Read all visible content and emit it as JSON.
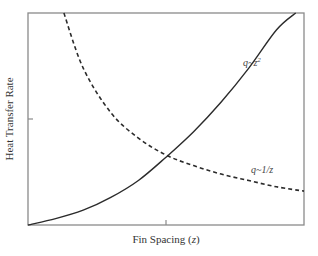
{
  "chart_data": {
    "type": "line",
    "title": "",
    "xlabel": "Fin Spacing (z)",
    "xlabel_text": "Fin Spacing (",
    "xlabel_var": "z",
    "xlabel_close": ")",
    "ylabel": "Heat Transfer Rate",
    "xlim": [
      0,
      1
    ],
    "ylim": [
      0,
      1
    ],
    "grid": false,
    "legend": null,
    "x_ticks": [
      0.5
    ],
    "y_ticks": [
      0.5
    ],
    "tick_labels_shown": false,
    "series": [
      {
        "name": "q~z^2",
        "style": "solid",
        "label": "q~z",
        "label_sup": "2",
        "x": [
          0.0,
          0.1,
          0.2,
          0.3,
          0.4,
          0.5,
          0.6,
          0.7,
          0.8,
          0.9,
          0.97
        ],
        "y": [
          0.0,
          0.03,
          0.07,
          0.13,
          0.21,
          0.32,
          0.44,
          0.58,
          0.74,
          0.92,
          1.0
        ]
      },
      {
        "name": "q~1/z",
        "style": "dashed",
        "label": "q~1/z",
        "x": [
          0.13,
          0.2,
          0.3,
          0.4,
          0.5,
          0.6,
          0.7,
          0.8,
          0.9,
          1.0
        ],
        "y": [
          1.0,
          0.74,
          0.53,
          0.41,
          0.33,
          0.28,
          0.24,
          0.21,
          0.18,
          0.16
        ]
      }
    ],
    "annotations": [
      {
        "text": "q~z^2",
        "x": 0.82,
        "y": 0.78
      },
      {
        "text": "q~1/z",
        "x": 0.82,
        "y": 0.31
      }
    ]
  },
  "colors": {
    "axis": "#8a8a8a",
    "line": "#2b2b2b",
    "text": "#333333"
  }
}
